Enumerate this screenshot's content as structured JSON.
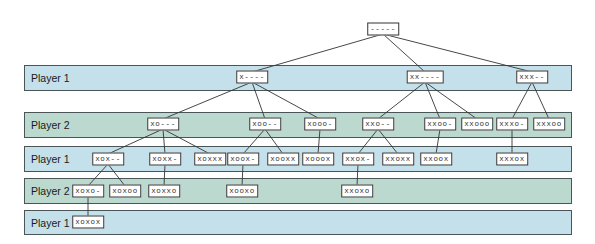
{
  "bands": [
    {
      "label": "Player 1",
      "player": 1,
      "top": 65,
      "height": 26
    },
    {
      "label": "Player 2",
      "player": 2,
      "top": 112,
      "height": 26
    },
    {
      "label": "Player 1",
      "player": 1,
      "top": 146,
      "height": 26
    },
    {
      "label": "Player 2",
      "player": 2,
      "top": 178,
      "height": 26
    },
    {
      "label": "Player 1",
      "player": 1,
      "top": 210,
      "height": 25
    }
  ],
  "colors": {
    "player1_band": "#c4e0ea",
    "player2_band": "#bcd9cf",
    "border": "#4a5558",
    "edge": "#333333"
  },
  "nodes": [
    {
      "id": "root",
      "label": "-----",
      "x": 383,
      "y": 29
    },
    {
      "id": "n1",
      "label": "x----",
      "x": 252,
      "y": 77
    },
    {
      "id": "n2",
      "label": "xx----",
      "x": 425,
      "y": 77
    },
    {
      "id": "n3",
      "label": "xxx--",
      "x": 532,
      "y": 77
    },
    {
      "id": "n4",
      "label": "xo---",
      "x": 163,
      "y": 124
    },
    {
      "id": "n5",
      "label": "xoo--",
      "x": 265,
      "y": 124
    },
    {
      "id": "n6",
      "label": "xooo-",
      "x": 320,
      "y": 124
    },
    {
      "id": "n7",
      "label": "xxo--",
      "x": 378,
      "y": 124
    },
    {
      "id": "n8",
      "label": "xxoo-",
      "x": 440,
      "y": 124
    },
    {
      "id": "n9",
      "label": "xxooo",
      "x": 477,
      "y": 124
    },
    {
      "id": "n10",
      "label": "xxxo-",
      "x": 512,
      "y": 124
    },
    {
      "id": "n11",
      "label": "xxxoo",
      "x": 549,
      "y": 124
    },
    {
      "id": "n12",
      "label": "xox--",
      "x": 108,
      "y": 159
    },
    {
      "id": "n13",
      "label": "xoxx-",
      "x": 165,
      "y": 159
    },
    {
      "id": "n14",
      "label": "xoxxx",
      "x": 210,
      "y": 159
    },
    {
      "id": "n15",
      "label": "xoox-",
      "x": 243,
      "y": 159
    },
    {
      "id": "n16",
      "label": "xooxx",
      "x": 283,
      "y": 159
    },
    {
      "id": "n17",
      "label": "xooox",
      "x": 318,
      "y": 159
    },
    {
      "id": "n18",
      "label": "xxox-",
      "x": 358,
      "y": 159
    },
    {
      "id": "n19",
      "label": "xxoxx",
      "x": 398,
      "y": 159
    },
    {
      "id": "n20",
      "label": "xxoox",
      "x": 436,
      "y": 159
    },
    {
      "id": "n21",
      "label": "xxxox",
      "x": 512,
      "y": 159
    },
    {
      "id": "n22",
      "label": "xoxo-",
      "x": 88,
      "y": 191
    },
    {
      "id": "n23",
      "label": "xoxoo",
      "x": 125,
      "y": 191
    },
    {
      "id": "n24",
      "label": "xoxxo",
      "x": 164,
      "y": 191
    },
    {
      "id": "n25",
      "label": "xooxo",
      "x": 242,
      "y": 191
    },
    {
      "id": "n26",
      "label": "xxoxo",
      "x": 357,
      "y": 191
    },
    {
      "id": "n27",
      "label": "xoxox",
      "x": 88,
      "y": 222
    }
  ],
  "edges": [
    [
      "root",
      "n1"
    ],
    [
      "root",
      "n2"
    ],
    [
      "root",
      "n3"
    ],
    [
      "n1",
      "n4"
    ],
    [
      "n1",
      "n5"
    ],
    [
      "n1",
      "n6"
    ],
    [
      "n2",
      "n7"
    ],
    [
      "n2",
      "n8"
    ],
    [
      "n2",
      "n9"
    ],
    [
      "n3",
      "n10"
    ],
    [
      "n3",
      "n11"
    ],
    [
      "n4",
      "n12"
    ],
    [
      "n4",
      "n13"
    ],
    [
      "n4",
      "n14"
    ],
    [
      "n5",
      "n15"
    ],
    [
      "n5",
      "n16"
    ],
    [
      "n6",
      "n17"
    ],
    [
      "n7",
      "n18"
    ],
    [
      "n7",
      "n19"
    ],
    [
      "n8",
      "n20"
    ],
    [
      "n10",
      "n21"
    ],
    [
      "n12",
      "n22"
    ],
    [
      "n12",
      "n23"
    ],
    [
      "n13",
      "n24"
    ],
    [
      "n15",
      "n25"
    ],
    [
      "n18",
      "n26"
    ],
    [
      "n22",
      "n27"
    ]
  ]
}
